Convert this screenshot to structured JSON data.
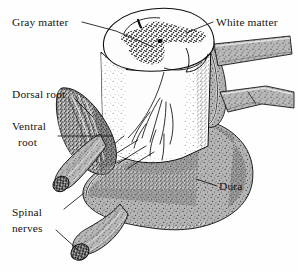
{
  "figure": {
    "background_color": "#fefefe",
    "ink_color": "#0d0d0d",
    "dura_fill_color": "#a8a8a8",
    "white_matter_color": "#fdfdfd",
    "gray_matter_stipple_color": "#242424",
    "style": "pen-and-ink stipple anatomical illustration"
  },
  "labels": [
    {
      "id": "gray-matter",
      "text": "Gray matter",
      "lines": [
        "Gray matter"
      ],
      "position": "top-left",
      "text_x": 12,
      "text_y": 26,
      "anchor": "start",
      "leader": "M 82 24 L 115 32 L 152 46"
    },
    {
      "id": "white-matter",
      "text": "White matter",
      "lines": [
        "White matter"
      ],
      "position": "top-right",
      "text_x": 216,
      "text_y": 26,
      "anchor": "start",
      "leader": "M 213 24 L 186 34"
    },
    {
      "id": "dorsal-root",
      "text": "Dorsal root",
      "lines": [
        "Dorsal root"
      ],
      "position": "mid-left",
      "text_x": 12,
      "text_y": 98,
      "anchor": "start",
      "leader": "M 74 100 L 92 116"
    },
    {
      "id": "ventral-root",
      "text": "Ventral root",
      "lines": [
        "Ventral",
        "root"
      ],
      "position": "mid-left",
      "text_x": 12,
      "text_y": 130,
      "anchor": "start",
      "leader": "M 60 136 L 110 136"
    },
    {
      "id": "dura",
      "text": "Dura",
      "lines": [
        "Dura"
      ],
      "position": "right",
      "text_x": 219,
      "text_y": 190,
      "anchor": "start",
      "leader": "M 216 186 L 196 180"
    },
    {
      "id": "spinal-nerves",
      "text": "Spinal nerves",
      "lines": [
        "Spinal",
        "nerves"
      ],
      "position": "bottom-left",
      "text_x": 12,
      "text_y": 216,
      "anchor": "start",
      "leader_upper": "M 66 210 L 82 194",
      "leader_lower": "M 58 232 L 78 250"
    }
  ],
  "structures": [
    {
      "id": "spinal-cord-cross-section",
      "name": "Spinal cord cut face (transverse section)"
    },
    {
      "id": "gray-matter-butterfly",
      "name": "Butterfly-shaped gray matter"
    },
    {
      "id": "central-canal",
      "name": "Central canal"
    },
    {
      "id": "white-matter-region",
      "name": "Surrounding white matter"
    },
    {
      "id": "dura-mater-sheath",
      "name": "Dura mater sheath (opened)"
    },
    {
      "id": "dorsal-rootlets",
      "name": "Dorsal rootlets fanning to dorsal root"
    },
    {
      "id": "ventral-rootlets",
      "name": "Ventral rootlets"
    },
    {
      "id": "spinal-nerve-left",
      "name": "Cut spinal nerve (upper left)"
    },
    {
      "id": "spinal-nerve-bottom",
      "name": "Cut spinal nerve (bottom)"
    },
    {
      "id": "spinal-nerve-branch-upper-right",
      "name": "Spinal nerve branch (upper right)"
    },
    {
      "id": "spinal-nerve-branch-lower-right",
      "name": "Spinal nerve branch (lower right)"
    }
  ]
}
